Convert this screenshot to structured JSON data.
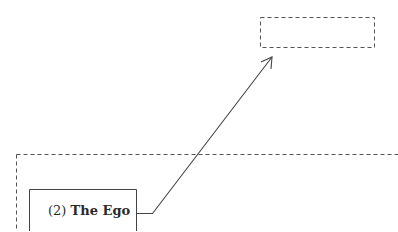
{
  "diagram": {
    "nodes": [
      {
        "id": "ego",
        "number": "(2)",
        "title": "The Ego",
        "style": "solid-box"
      },
      {
        "id": "empty-target",
        "title": "",
        "style": "dashed-box"
      }
    ],
    "regions": [
      {
        "id": "outer-frame",
        "style": "dashed-frame"
      }
    ],
    "edges": [
      {
        "from": "ego",
        "to": "empty-target",
        "style": "arrow"
      }
    ],
    "colors": {
      "stroke": "#444444",
      "text": "#2a2a2a",
      "background": "#ffffff"
    }
  }
}
